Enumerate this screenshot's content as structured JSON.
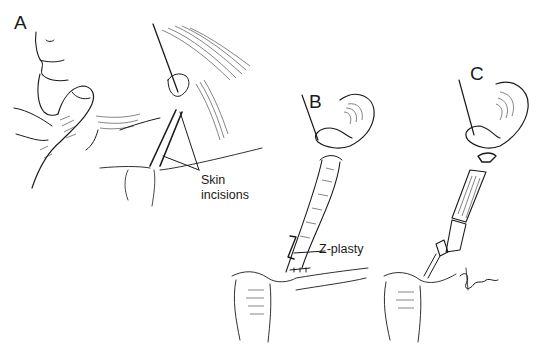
{
  "figure": {
    "panels": [
      {
        "id": "A",
        "label": "A",
        "description": "Patient head turned, finger palpating neck; skin incisions along sternocleidomastoid"
      },
      {
        "id": "B",
        "label": "B",
        "description": "Muscle released from clavicle/sternum and lengthened with Z-plasty"
      },
      {
        "id": "C",
        "label": "C",
        "description": "Muscle divided at mastoid end and distal heads"
      }
    ],
    "annotations": {
      "skin_incisions_line1": "Skin",
      "skin_incisions_line2": "incisions",
      "z_plasty": "Z-plasty"
    },
    "signature": "Hoyle",
    "colors": {
      "ink": "#1a1a1a",
      "background": "#ffffff"
    }
  }
}
